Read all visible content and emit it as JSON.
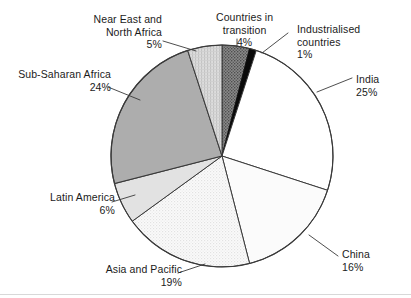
{
  "chart_data": {
    "type": "pie",
    "title": "",
    "subtitle": "",
    "xlabel": "",
    "ylabel": "",
    "legend_position": "none",
    "grid": false,
    "start_angle_deg": 0,
    "direction": "clockwise",
    "unit": "%",
    "categories": [
      "Countries in transition",
      "Industrialised countries",
      "India",
      "China",
      "Asia and Pacific",
      "Latin America",
      "Sub-Saharan Africa",
      "Near East and North Africa"
    ],
    "values": [
      4,
      1,
      25,
      16,
      19,
      6,
      24,
      5
    ],
    "slices": [
      {
        "id": "countries-in-transition",
        "name": "Countries in transition",
        "name_lines": [
          "Countries in",
          "transition"
        ],
        "percent_label": "4%",
        "value": 4,
        "fill": "#787878",
        "pattern": "dark-stipple",
        "start_deg": 0,
        "end_deg": 14.4
      },
      {
        "id": "industrialised-countries",
        "name": "Industrialised countries",
        "name_lines": [
          "Industrialised",
          "countries"
        ],
        "percent_label": "1%",
        "value": 1,
        "fill": "#0a0a0a",
        "pattern": "solid",
        "start_deg": 14.4,
        "end_deg": 18.0
      },
      {
        "id": "india",
        "name": "India",
        "name_lines": [
          "India"
        ],
        "percent_label": "25%",
        "value": 25,
        "fill": "#ffffff",
        "pattern": "none",
        "start_deg": 18.0,
        "end_deg": 108.0
      },
      {
        "id": "china",
        "name": "China",
        "name_lines": [
          "China"
        ],
        "percent_label": "16%",
        "value": 16,
        "fill": "#fbfbfb",
        "pattern": "none",
        "start_deg": 108.0,
        "end_deg": 165.6
      },
      {
        "id": "asia-and-pacific",
        "name": "Asia and Pacific",
        "name_lines": [
          "Asia and Pacific"
        ],
        "percent_label": "19%",
        "value": 19,
        "fill": "#f1f1f1",
        "pattern": "light-stipple",
        "start_deg": 165.6,
        "end_deg": 234.0
      },
      {
        "id": "latin-america",
        "name": "Latin America",
        "name_lines": [
          "Latin America"
        ],
        "percent_label": "6%",
        "value": 6,
        "fill": "#e2e2e2",
        "pattern": "solid",
        "start_deg": 234.0,
        "end_deg": 255.6
      },
      {
        "id": "sub-saharan-africa",
        "name": "Sub-Saharan Africa",
        "name_lines": [
          "Sub-Saharan Africa"
        ],
        "percent_label": "24%",
        "value": 24,
        "fill": "#adadad",
        "pattern": "solid",
        "start_deg": 255.6,
        "end_deg": 342.0
      },
      {
        "id": "near-east-and-north-africa",
        "name": "Near East and North Africa",
        "name_lines": [
          "Near East and",
          "North Africa"
        ],
        "percent_label": "5%",
        "value": 5,
        "fill": "#d4d4d4",
        "pattern": "hatch-vertical",
        "start_deg": 342.0,
        "end_deg": 360.0
      }
    ],
    "colors": {
      "outline": "#3a3a3a",
      "leader_line": "#3a3a3a",
      "text": "#1b1b1b",
      "background": "#ffffff"
    }
  },
  "labels": {
    "near_east": {
      "line1": "Near East and",
      "line2": "North Africa",
      "percent": "5%"
    },
    "sub_saharan": {
      "line1": "Sub-Saharan Africa",
      "percent": "24%"
    },
    "latin_america": {
      "line1": "Latin America",
      "percent": "6%"
    },
    "asia_pacific": {
      "line1": "Asia and Pacific",
      "percent": "19%"
    },
    "countries_transition": {
      "line1": "Countries in",
      "line2": "transition",
      "percent": "4%"
    },
    "industrialised": {
      "line1": "Industrialised",
      "line2": "countries",
      "percent": "1%"
    },
    "india": {
      "line1": "India",
      "percent": "25%"
    },
    "china": {
      "line1": "China",
      "percent": "16%"
    }
  }
}
